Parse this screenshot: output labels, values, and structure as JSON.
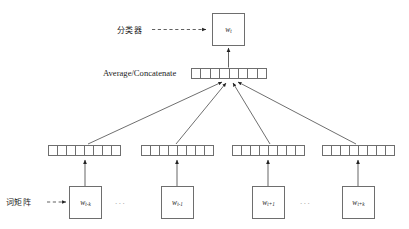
{
  "diagram": {
    "colors": {
      "background": "#ffffff",
      "stroke": "#6e6e6e",
      "line": "#4a4a4a",
      "text": "#1d1d1d"
    },
    "labels": {
      "classifier": "分类器",
      "average_concatenate": "Average/Concatenate",
      "word_matrix": "词矩阵",
      "ellipsis": "..."
    },
    "output_node": {
      "symbol": "w",
      "subscript": "t"
    },
    "context_nodes": [
      {
        "symbol": "w",
        "subscript": "t-k"
      },
      {
        "symbol": "w",
        "subscript": "t-1"
      },
      {
        "symbol": "w",
        "subscript": "t+1"
      },
      {
        "symbol": "w",
        "subscript": "t+k"
      }
    ],
    "vectors": {
      "projection_cells": 8,
      "embedding_cells": 8,
      "rows": 4
    }
  }
}
